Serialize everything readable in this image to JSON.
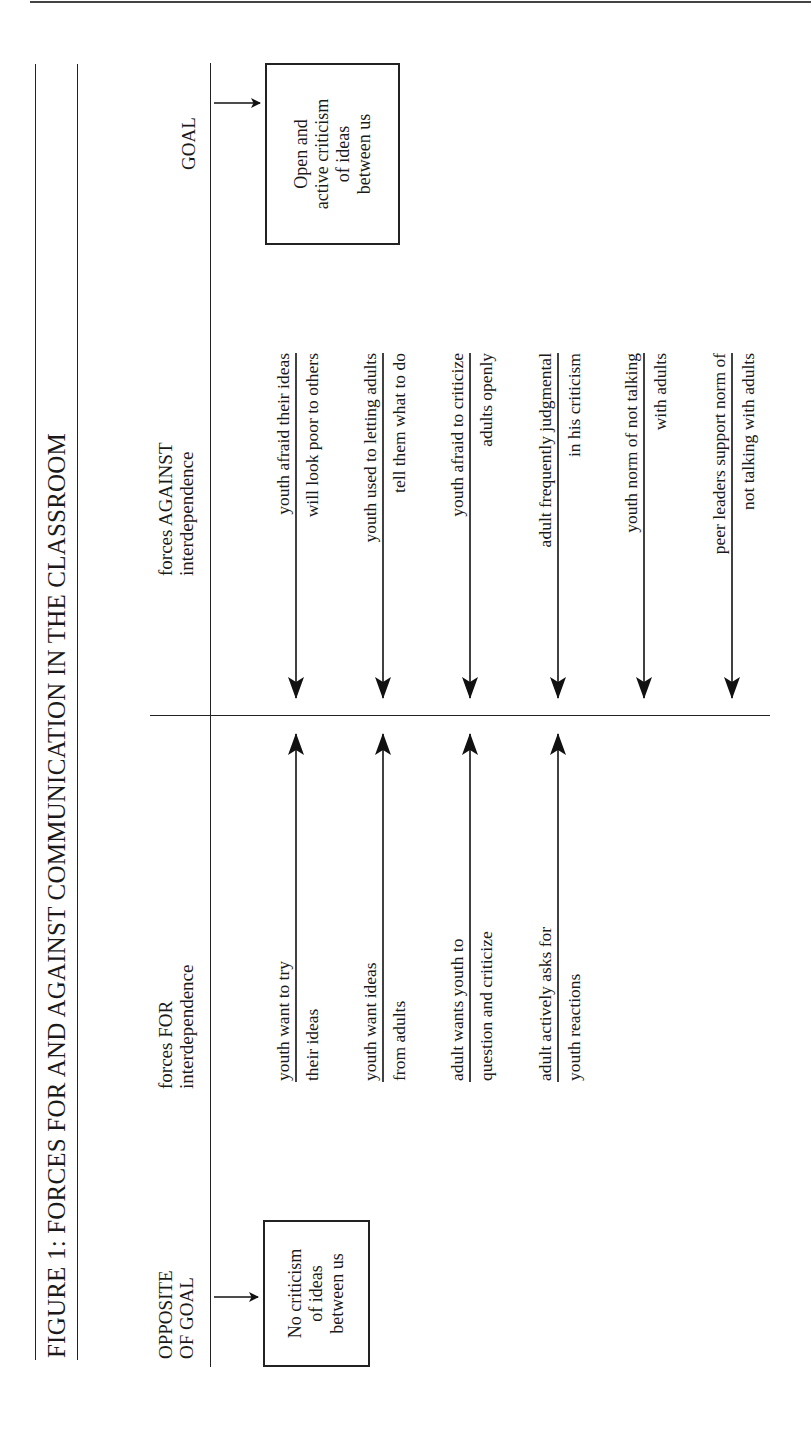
{
  "figure": {
    "title": "FIGURE 1: FORCES FOR AND AGAINST COMMUNICATION IN THE CLASSROOM",
    "goal": {
      "label": "GOAL",
      "box_lines": [
        "Open and",
        "active criticism",
        "of ideas",
        "between us"
      ]
    },
    "opposite_goal": {
      "label_lines": [
        "OPPOSITE",
        "OF GOAL"
      ],
      "box_lines": [
        "No criticism",
        "of ideas",
        "between us"
      ]
    },
    "forces_for": {
      "heading_lines": [
        "forces FOR",
        "interdependence"
      ],
      "items": [
        {
          "line1": "youth want to try",
          "line2": "their ideas"
        },
        {
          "line1": "youth want ideas",
          "line2": "from adults"
        },
        {
          "line1": "adult wants youth to",
          "line2": "question and criticize"
        },
        {
          "line1": "adult actively asks for",
          "line2": "youth reactions"
        }
      ]
    },
    "forces_against": {
      "heading_lines": [
        "forces AGAINST",
        "interdependence"
      ],
      "items": [
        {
          "line1": "youth afraid their ideas",
          "line2": "will look poor to others"
        },
        {
          "line1": "youth used to letting adults",
          "line2": "tell them what to do"
        },
        {
          "line1": "youth afraid to criticize",
          "line2": "adults openly"
        },
        {
          "line1": "adult frequently judgmental",
          "line2": "in his criticism"
        },
        {
          "line1": "youth norm of not talking",
          "line2": "with adults"
        },
        {
          "line1": "peer leaders support norm of",
          "line2": "not talking with adults"
        }
      ]
    }
  }
}
